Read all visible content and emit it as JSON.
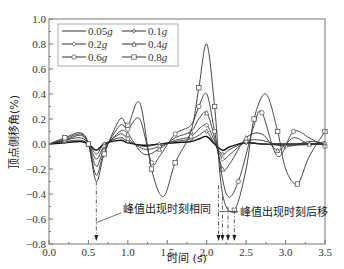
{
  "chart_data": {
    "type": "line",
    "title": "",
    "xlabel": "时间 (s)",
    "ylabel": "顶点侧移角(%)",
    "xlim": [
      0.0,
      3.5
    ],
    "ylim": [
      -0.8,
      1.0
    ],
    "x_ticks": [
      "0.0",
      "0.5",
      "1.0",
      "1.5",
      "2.0",
      "2.5",
      "3.0",
      "3.5"
    ],
    "y_ticks": [
      "1.0",
      "0.8",
      "0.6",
      "0.4",
      "0.2",
      "0.0",
      "-0.2",
      "-0.4",
      "-0.6",
      "-0.8"
    ],
    "grid": false,
    "legend_position": "upper left",
    "series": [
      {
        "name": "0.05g",
        "marker": "none",
        "points": [
          [
            0,
            0
          ],
          [
            0.2,
            0.01
          ],
          [
            0.4,
            0.02
          ],
          [
            0.5,
            0.0
          ],
          [
            0.6,
            -0.05
          ],
          [
            0.7,
            0.0
          ],
          [
            0.9,
            0.03
          ],
          [
            1.0,
            0.01
          ],
          [
            1.2,
            -0.01
          ],
          [
            1.4,
            0.0
          ],
          [
            1.6,
            0.01
          ],
          [
            1.8,
            0.02
          ],
          [
            1.9,
            0.04
          ],
          [
            2.0,
            0.06
          ],
          [
            2.1,
            0.0
          ],
          [
            2.2,
            -0.05
          ],
          [
            2.3,
            -0.02
          ],
          [
            2.5,
            0.01
          ],
          [
            2.7,
            0.0
          ],
          [
            3.0,
            0.0
          ],
          [
            3.5,
            0.0
          ]
        ]
      },
      {
        "name": "0.1g",
        "marker": "star",
        "points": [
          [
            0,
            0
          ],
          [
            0.2,
            0.02
          ],
          [
            0.4,
            0.03
          ],
          [
            0.5,
            0.0
          ],
          [
            0.6,
            -0.08
          ],
          [
            0.7,
            0.0
          ],
          [
            0.9,
            0.05
          ],
          [
            1.0,
            0.02
          ],
          [
            1.2,
            -0.02
          ],
          [
            1.4,
            0.0
          ],
          [
            1.6,
            0.02
          ],
          [
            1.8,
            0.04
          ],
          [
            1.9,
            0.07
          ],
          [
            2.0,
            0.1
          ],
          [
            2.1,
            0.0
          ],
          [
            2.2,
            -0.08
          ],
          [
            2.3,
            -0.04
          ],
          [
            2.5,
            0.01
          ],
          [
            2.7,
            0.0
          ],
          [
            3.0,
            -0.01
          ],
          [
            3.5,
            0.0
          ]
        ]
      },
      {
        "name": "0.2g",
        "marker": "diamond",
        "points": [
          [
            0,
            0
          ],
          [
            0.2,
            0.03
          ],
          [
            0.4,
            0.05
          ],
          [
            0.5,
            0.0
          ],
          [
            0.6,
            -0.12
          ],
          [
            0.7,
            -0.02
          ],
          [
            0.9,
            0.08
          ],
          [
            1.0,
            0.04
          ],
          [
            1.2,
            -0.04
          ],
          [
            1.4,
            -0.02
          ],
          [
            1.6,
            0.03
          ],
          [
            1.8,
            0.06
          ],
          [
            1.9,
            0.12
          ],
          [
            2.0,
            0.15
          ],
          [
            2.1,
            0.02
          ],
          [
            2.2,
            -0.12
          ],
          [
            2.3,
            -0.08
          ],
          [
            2.5,
            0.02
          ],
          [
            2.7,
            0.03
          ],
          [
            3.0,
            -0.02
          ],
          [
            3.3,
            0.02
          ],
          [
            3.5,
            0.0
          ]
        ]
      },
      {
        "name": "0.4g",
        "marker": "triangle",
        "points": [
          [
            0,
            0
          ],
          [
            0.2,
            0.03
          ],
          [
            0.4,
            0.07
          ],
          [
            0.5,
            0.0
          ],
          [
            0.6,
            -0.18
          ],
          [
            0.7,
            -0.04
          ],
          [
            0.9,
            0.1
          ],
          [
            1.0,
            0.08
          ],
          [
            1.2,
            -0.08
          ],
          [
            1.4,
            -0.04
          ],
          [
            1.6,
            0.05
          ],
          [
            1.8,
            0.1
          ],
          [
            1.9,
            0.2
          ],
          [
            2.0,
            0.25
          ],
          [
            2.1,
            0.05
          ],
          [
            2.2,
            -0.2
          ],
          [
            2.3,
            -0.15
          ],
          [
            2.5,
            0.05
          ],
          [
            2.7,
            0.08
          ],
          [
            2.9,
            -0.05
          ],
          [
            3.1,
            0.05
          ],
          [
            3.3,
            0.0
          ],
          [
            3.5,
            0.02
          ]
        ]
      },
      {
        "name": "0.6g",
        "marker": "circle",
        "points": [
          [
            0,
            0
          ],
          [
            0.2,
            0.04
          ],
          [
            0.4,
            0.08
          ],
          [
            0.5,
            0.0
          ],
          [
            0.6,
            -0.25
          ],
          [
            0.7,
            -0.06
          ],
          [
            0.9,
            0.15
          ],
          [
            1.0,
            0.12
          ],
          [
            1.15,
            0.2
          ],
          [
            1.3,
            -0.15
          ],
          [
            1.4,
            -0.1
          ],
          [
            1.6,
            0.08
          ],
          [
            1.8,
            0.15
          ],
          [
            1.9,
            0.3
          ],
          [
            2.0,
            0.4
          ],
          [
            2.1,
            0.1
          ],
          [
            2.25,
            -0.4
          ],
          [
            2.4,
            -0.3
          ],
          [
            2.6,
            0.15
          ],
          [
            2.7,
            0.25
          ],
          [
            2.9,
            -0.1
          ],
          [
            3.1,
            0.1
          ],
          [
            3.3,
            0.05
          ],
          [
            3.5,
            -0.02
          ]
        ]
      },
      {
        "name": "0.8g",
        "marker": "square",
        "points": [
          [
            0,
            0
          ],
          [
            0.2,
            0.05
          ],
          [
            0.4,
            0.09
          ],
          [
            0.5,
            0.0
          ],
          [
            0.6,
            -0.3
          ],
          [
            0.7,
            -0.08
          ],
          [
            0.9,
            0.2
          ],
          [
            1.0,
            0.15
          ],
          [
            1.15,
            0.33
          ],
          [
            1.3,
            -0.2
          ],
          [
            1.45,
            -0.42
          ],
          [
            1.6,
            -0.15
          ],
          [
            1.8,
            0.1
          ],
          [
            1.9,
            0.45
          ],
          [
            2.0,
            0.8
          ],
          [
            2.1,
            0.3
          ],
          [
            2.2,
            -0.4
          ],
          [
            2.35,
            -0.53
          ],
          [
            2.5,
            -0.2
          ],
          [
            2.6,
            0.2
          ],
          [
            2.75,
            0.4
          ],
          [
            2.9,
            0.1
          ],
          [
            3.0,
            -0.2
          ],
          [
            3.15,
            -0.32
          ],
          [
            3.3,
            -0.1
          ],
          [
            3.5,
            0.1
          ]
        ]
      }
    ],
    "annotations": [
      {
        "text": "峰值出现时刻相同",
        "x": 0.6,
        "arrows_x": [
          0.6
        ]
      },
      {
        "text": "峰值出现时刻后移",
        "x": 2.25,
        "arrows_x": [
          2.15,
          2.2,
          2.27,
          2.35
        ]
      }
    ]
  },
  "legend": {
    "items": [
      "0.05g",
      "0.1g",
      "0.2g",
      "0.4g",
      "0.6g",
      "0.8g"
    ]
  }
}
